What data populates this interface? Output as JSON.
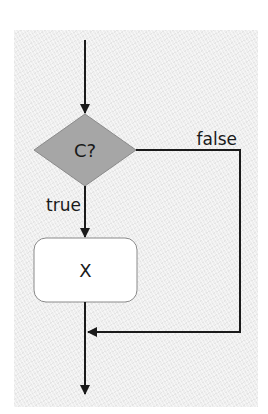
{
  "diagram": {
    "type": "flowchart",
    "nodes": [
      {
        "id": "decision",
        "shape": "diamond",
        "label": "C?",
        "fill": "#a6a6a6"
      },
      {
        "id": "process",
        "shape": "rounded-rectangle",
        "label": "X",
        "fill": "#ffffff"
      }
    ],
    "edges": [
      {
        "from": "entry",
        "to": "decision",
        "label": ""
      },
      {
        "from": "decision",
        "to": "process",
        "label": "true"
      },
      {
        "from": "decision",
        "to": "merge",
        "label": "false"
      },
      {
        "from": "process",
        "to": "merge",
        "label": ""
      },
      {
        "from": "merge",
        "to": "exit",
        "label": ""
      }
    ],
    "labels": {
      "decision": "C?",
      "process": "X",
      "true_branch": "true",
      "false_branch": "false"
    },
    "colors": {
      "background_panel": "#eeeeee",
      "decision_fill": "#a6a6a6",
      "process_fill": "#ffffff",
      "lines": "#1a1a1a",
      "node_border": "#8a8a8a"
    }
  }
}
